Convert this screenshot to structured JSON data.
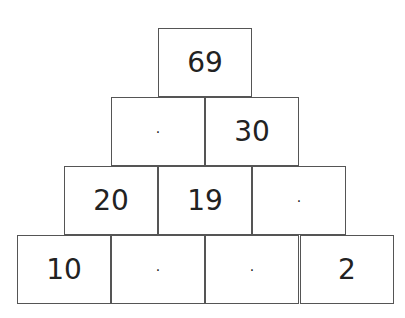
{
  "pyramid": {
    "rows": [
      [
        "69"
      ],
      [
        "·",
        "30"
      ],
      [
        "20",
        "19",
        "·"
      ],
      [
        "10",
        "·",
        "·",
        "2"
      ]
    ]
  }
}
